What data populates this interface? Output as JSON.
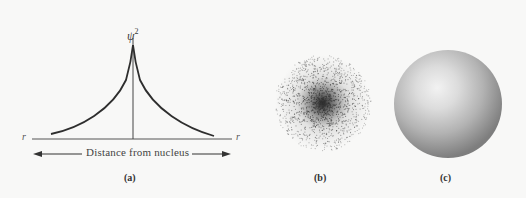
{
  "figure": {
    "panels": [
      {
        "id": "a",
        "label": "(a)",
        "type": "probability-density-plot",
        "y_axis_label": "ψ",
        "y_axis_label_exponent": "2",
        "x_axis_left_label": "r",
        "x_axis_right_label": "r",
        "x_axis_caption": "Distance from nucleus"
      },
      {
        "id": "b",
        "label": "(b)",
        "type": "electron-dot-density-cloud"
      },
      {
        "id": "c",
        "label": "(c)",
        "type": "shaded-sphere"
      }
    ],
    "colors": {
      "background": "#f8f8f7",
      "ink": "#2e2e2e",
      "sphere_highlight": "#ececec",
      "sphere_shadow": "#8a8a8a"
    }
  },
  "chart_data": {
    "type": "line",
    "title": "",
    "xlabel": "Distance from nucleus",
    "ylabel": "ψ²",
    "x": [
      -1.0,
      -0.8,
      -0.6,
      -0.4,
      -0.2,
      -0.1,
      0,
      0.1,
      0.2,
      0.4,
      0.6,
      0.8,
      1.0
    ],
    "values": [
      0.05,
      0.08,
      0.13,
      0.22,
      0.45,
      0.65,
      1.0,
      0.65,
      0.45,
      0.22,
      0.13,
      0.08,
      0.05
    ],
    "grid": false,
    "legend": null
  }
}
